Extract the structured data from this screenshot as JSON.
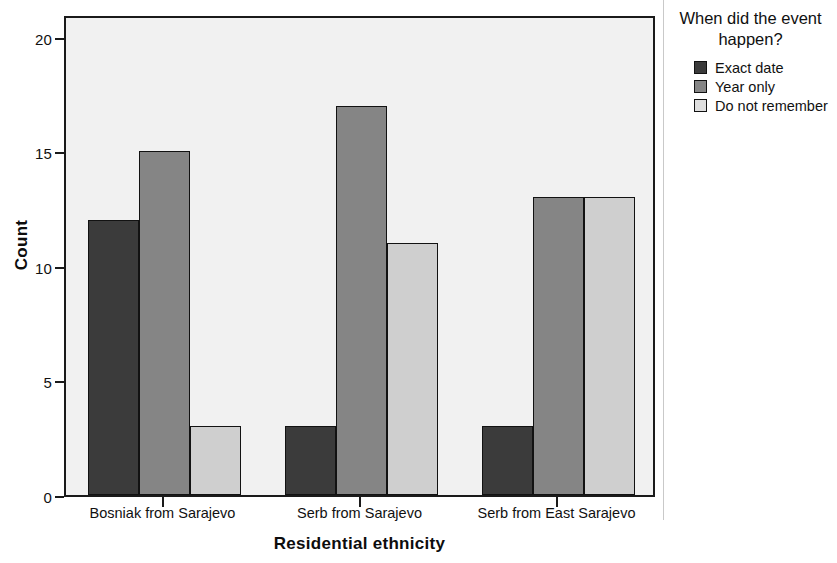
{
  "chart_data": {
    "type": "bar",
    "title": "",
    "xlabel": "Residential ethnicity",
    "ylabel": "Count",
    "categories": [
      "Bosniak from Sarajevo",
      "Serb from Sarajevo",
      "Serb from East Sarajevo"
    ],
    "series": [
      {
        "name": "Exact date",
        "values": [
          12,
          3,
          3
        ],
        "color": "#3b3b3b"
      },
      {
        "name": "Year only",
        "values": [
          15,
          17,
          13
        ],
        "color": "#858585"
      },
      {
        "name": "Do not remember",
        "values": [
          3,
          11,
          13
        ],
        "color": "#cfcfcf"
      }
    ],
    "ylim": [
      0,
      21
    ],
    "yticks": [
      0,
      5,
      10,
      15,
      20
    ],
    "ytick_labels": [
      "0",
      "5",
      "10",
      "15",
      "20"
    ],
    "grid": false,
    "legend_position": "right",
    "legend_title": "When did the event happen?",
    "plot_background": "#f1f1f1",
    "axis_color": "#1a1a1a"
  },
  "legend": {
    "title_line_1": "When did the event",
    "title_line_2": "happen?"
  },
  "axes": {
    "y_title": "Count",
    "x_title": "Residential ethnicity"
  }
}
